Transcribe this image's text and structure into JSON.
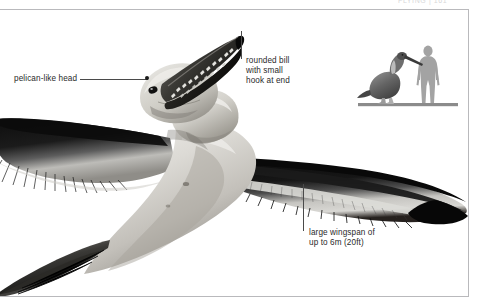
{
  "page": {
    "running_head": "FLYING  |  161",
    "width": 482,
    "height": 302,
    "background_color": "#ffffff",
    "rule_color": "#b9b9bc"
  },
  "illustration": {
    "subject": "giant pseudo-toothed seabird in flight, greyscale photo-illustration",
    "view": "underside, wings fully spread, head raised with long serrated bill",
    "palette": {
      "feather_dark": "#151515",
      "feather_mid": "#6e6e6e",
      "body_light": "#d5d3ce",
      "body_shadow": "#8d8a84",
      "highlight": "#f2f1ee"
    }
  },
  "callouts": [
    {
      "id": "pelican-like-head",
      "text": "pelican-like head",
      "leader": "horizontal line ending in a dot on the head"
    },
    {
      "id": "rounded-bill",
      "text": "rounded bill\nwith small\nhook at end",
      "leader": "vertical line up to the bill tip"
    },
    {
      "id": "large-wingspan",
      "text": "large wingspan of\nup to 6m (20ft)",
      "leader": "vertical line up to the right wing"
    }
  ],
  "scale_inset": {
    "caption": "",
    "bird_label": "standing bird silhouette",
    "human_label": "human silhouette for scale",
    "ground_color": "#8b8b8b",
    "human_color": "#a0a0a0",
    "bird_color": "#6b6b6b"
  }
}
